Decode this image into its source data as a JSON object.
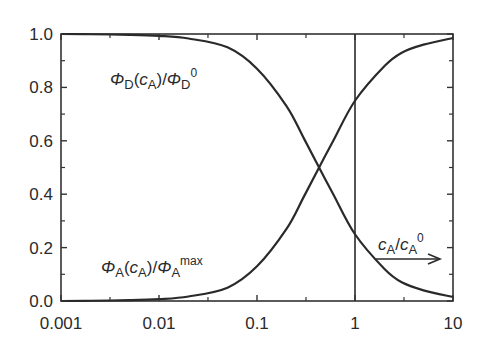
{
  "chart_data": {
    "type": "line",
    "title": "",
    "xlabel": "",
    "ylabel": "",
    "xscale": "log",
    "xlim": [
      0.001,
      10
    ],
    "ylim": [
      0.0,
      1.0
    ],
    "grid": false,
    "x_ticks": [
      "0.001",
      "0.01",
      "0.1",
      "1",
      "10"
    ],
    "x_tick_values": [
      0.001,
      0.01,
      0.1,
      1,
      10
    ],
    "y_ticks": [
      "0.0",
      "0.2",
      "0.4",
      "0.6",
      "0.8",
      "1.0"
    ],
    "y_tick_values": [
      0.0,
      0.2,
      0.4,
      0.6,
      0.8,
      1.0
    ],
    "vertical_line": {
      "x": 1
    },
    "x": [
      0.001,
      0.002,
      0.005,
      0.01,
      0.02,
      0.05,
      0.1,
      0.2,
      0.3,
      0.43,
      0.6,
      1,
      2,
      3,
      5,
      10
    ],
    "series": [
      {
        "name": "ΦD(cA)/ΦD0",
        "values": [
          1.0,
          0.999,
          0.997,
          0.993,
          0.983,
          0.95,
          0.87,
          0.73,
          0.61,
          0.5,
          0.4,
          0.25,
          0.12,
          0.07,
          0.04,
          0.015
        ]
      },
      {
        "name": "ΦA(cA)/ΦAmax",
        "values": [
          0.0,
          0.001,
          0.003,
          0.007,
          0.017,
          0.05,
          0.13,
          0.27,
          0.39,
          0.5,
          0.6,
          0.75,
          0.88,
          0.93,
          0.96,
          0.985
        ]
      }
    ],
    "annotations": [
      {
        "text": "ΦD(cA)/ΦD0",
        "position": "upper-left",
        "near_series": "ΦD(cA)/ΦD0"
      },
      {
        "text": "ΦA(cA)/ΦAmax",
        "position": "lower-left",
        "near_series": "ΦA(cA)/ΦAmax"
      },
      {
        "text": "cA/cA0",
        "position": "lower-right with right arrow"
      }
    ]
  },
  "labels": {
    "phi_d": {
      "sym": "Φ",
      "sub1": "D",
      "open": "(",
      "c": "c",
      "sub2": "A",
      "close": ")/",
      "sym2": "Φ",
      "sub3": "D",
      "sup": "0"
    },
    "phi_a": {
      "sym": "Φ",
      "sub1": "A",
      "open": "(",
      "c": "c",
      "sub2": "A",
      "close": ")/",
      "sym2": "Φ",
      "sub3": "A",
      "sup": "max"
    },
    "ca_ratio": {
      "c1": "c",
      "sub1": "A",
      "slash": "/",
      "c2": "c",
      "sub2": "A",
      "sup": "0"
    }
  },
  "colors": {
    "line": "#2a2a2a",
    "axis": "#333333",
    "background": "#ffffff"
  }
}
